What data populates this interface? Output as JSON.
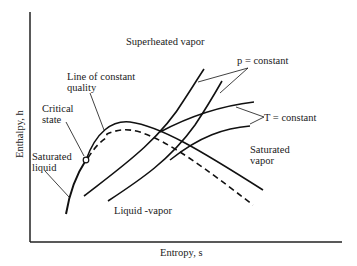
{
  "diagram": {
    "type": "Mollier (h-s) diagram",
    "axes": {
      "x_label": "Entropy, s",
      "y_label": "Enthalpy, h"
    },
    "regions": {
      "superheated": "Superheated vapor",
      "two_phase": "Liquid -vapor"
    },
    "annotations": {
      "constant_quality": [
        "Line of constant",
        "quality"
      ],
      "critical_state": [
        "Critical",
        "state"
      ],
      "saturated_liquid": [
        "Saturated",
        "liquid"
      ],
      "saturated_vapor": [
        "Saturated",
        "vapor"
      ],
      "p_constant": "p = constant",
      "t_constant": "T = constant"
    }
  }
}
